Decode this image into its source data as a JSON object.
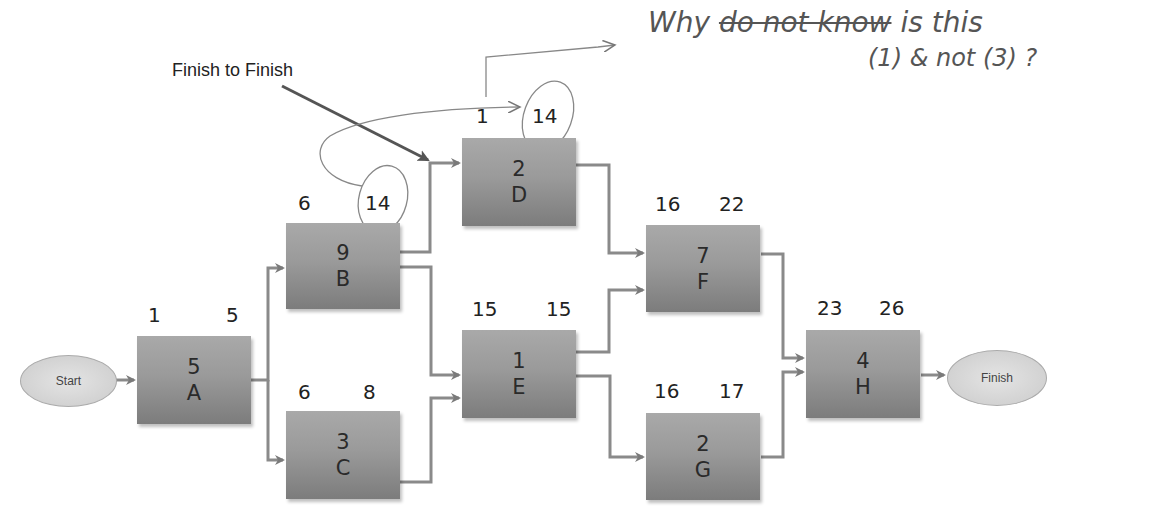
{
  "diagram": {
    "type": "network-diagram (activity-on-node)",
    "start_label": "Start",
    "finish_label": "Finish",
    "annotation_label": "Finish to Finish",
    "handwritten_note": {
      "line1_prefix": "Why",
      "line1_struck": "do not know",
      "line1_suffix": "is this",
      "line2": "(1) & not (3) ?"
    },
    "nodes": [
      {
        "id": "A",
        "duration": "5",
        "es": "1",
        "ef": "5"
      },
      {
        "id": "B",
        "duration": "9",
        "es": "6",
        "ef": "14"
      },
      {
        "id": "C",
        "duration": "3",
        "es": "6",
        "ef": "8"
      },
      {
        "id": "D",
        "duration": "2",
        "es": "1",
        "ef": "14"
      },
      {
        "id": "E",
        "duration": "1",
        "es": "15",
        "ef": "15"
      },
      {
        "id": "F",
        "duration": "7",
        "es": "16",
        "ef": "22"
      },
      {
        "id": "G",
        "duration": "2",
        "es": "16",
        "ef": "17"
      },
      {
        "id": "H",
        "duration": "4",
        "es": "23",
        "ef": "26"
      }
    ],
    "edges": [
      [
        "Start",
        "A"
      ],
      [
        "A",
        "B"
      ],
      [
        "A",
        "C"
      ],
      [
        "B",
        "D"
      ],
      [
        "B",
        "E"
      ],
      [
        "C",
        "E"
      ],
      [
        "D",
        "F"
      ],
      [
        "E",
        "F"
      ],
      [
        "E",
        "G"
      ],
      [
        "F",
        "H"
      ],
      [
        "G",
        "H"
      ],
      [
        "H",
        "Finish"
      ]
    ],
    "circled_values": [
      "B.ef: 14",
      "D.ef: 14"
    ]
  }
}
